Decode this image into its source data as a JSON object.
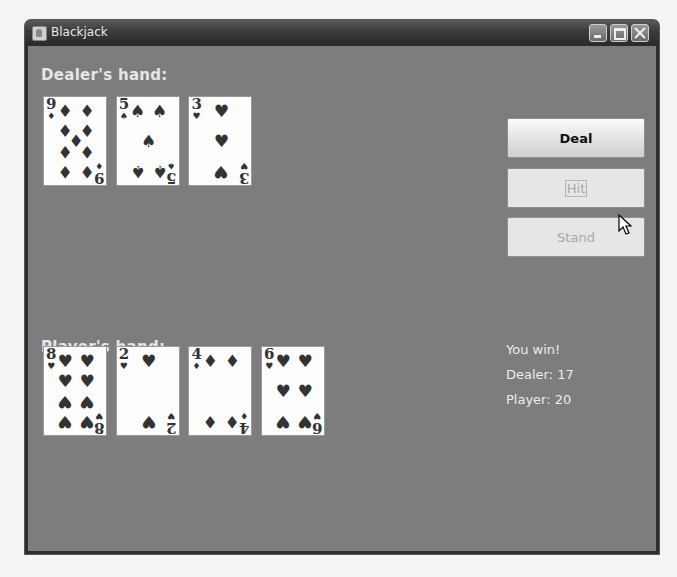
{
  "window": {
    "title": "Blackjack",
    "controls": {
      "minimize": "minimize",
      "maximize": "maximize",
      "close": "close"
    }
  },
  "dealer": {
    "label": "Dealer's hand:",
    "cards": [
      {
        "rank": "9",
        "suit": "♦",
        "suit_name": "diamonds"
      },
      {
        "rank": "5",
        "suit": "♠",
        "suit_name": "spades"
      },
      {
        "rank": "3",
        "suit": "♥",
        "suit_name": "hearts"
      }
    ]
  },
  "player": {
    "label": "Player's hand:",
    "cards": [
      {
        "rank": "8",
        "suit": "♥",
        "suit_name": "hearts"
      },
      {
        "rank": "2",
        "suit": "♥",
        "suit_name": "hearts"
      },
      {
        "rank": "4",
        "suit": "♦",
        "suit_name": "diamonds"
      },
      {
        "rank": "6",
        "suit": "♥",
        "suit_name": "hearts"
      }
    ]
  },
  "buttons": {
    "deal": {
      "label": "Deal",
      "enabled": true
    },
    "hit": {
      "label": "Hit",
      "enabled": false
    },
    "stand": {
      "label": "Stand",
      "enabled": false
    }
  },
  "status": {
    "result": "You win!",
    "dealer_score": "Dealer: 17",
    "player_score": "Player: 20"
  },
  "colors": {
    "table": "#7d7d7d",
    "titlebar": "#3a3a3a"
  }
}
